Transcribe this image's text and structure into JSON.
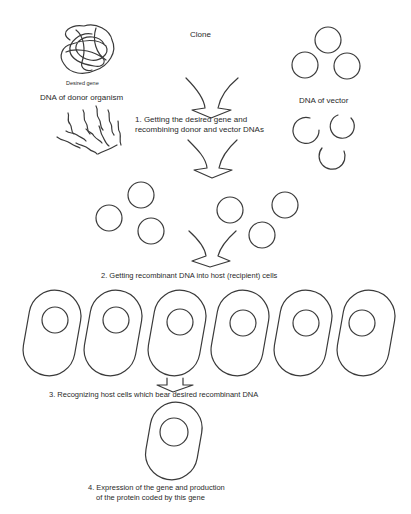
{
  "diagram": {
    "title": "Clone",
    "colors": {
      "stroke": "#3a3a3a",
      "text": "#2a2a2a",
      "background": "#ffffff"
    },
    "labels": {
      "desired_gene": "Desired gene",
      "donor_dna": "DNA of donor organism",
      "vector_dna": "DNA of vector"
    },
    "steps": [
      {
        "line1": "1. Getting the desired gene and",
        "line2": "recombining donor and vector DNAs"
      },
      {
        "line1": "2. Getting recombinant DNA into host (recipient) cells"
      },
      {
        "line1": "3. Recognizing host cells which bear desired recombinant DNA"
      },
      {
        "line1": "4. Expression of the gene and production",
        "line2": "of the protein coded by this gene"
      }
    ],
    "elements": {
      "donor_dna_tangle": 1,
      "donor_dna_fragments": 11,
      "vector_plasmids_intact": 3,
      "vector_plasmids_cut": 3,
      "recombinant_plasmids": 6,
      "host_cells": 6,
      "selected_cells": 1
    }
  }
}
